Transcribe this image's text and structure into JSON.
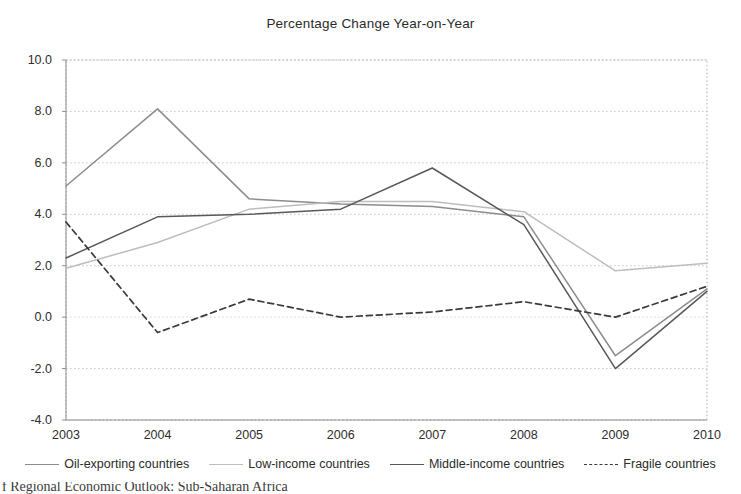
{
  "chart_data": {
    "type": "line",
    "title": "Percentage Change Year-on-Year",
    "xlabel": "",
    "ylabel": "",
    "x": [
      2003,
      2004,
      2005,
      2006,
      2007,
      2008,
      2009,
      2010
    ],
    "categories": [
      "2003",
      "2004",
      "2005",
      "2006",
      "2007",
      "2008",
      "2009",
      "2010"
    ],
    "xlim": [
      2003,
      2010
    ],
    "ylim": [
      -4.0,
      10.0
    ],
    "yticks": [
      "10.0",
      "8.0",
      "6.0",
      "4.0",
      "2.0",
      "0.0",
      "-2.0",
      "-4.0"
    ],
    "ytick_values": [
      10.0,
      8.0,
      6.0,
      4.0,
      2.0,
      0.0,
      -2.0,
      -4.0
    ],
    "grid": true,
    "grid_axis": "y",
    "legend_position": "bottom",
    "series": [
      {
        "name": "Oil-exporting countries",
        "style": "solid",
        "color": "#8c8c8c",
        "values": [
          5.1,
          8.1,
          4.6,
          4.4,
          4.3,
          3.9,
          -1.5,
          1.1
        ]
      },
      {
        "name": "Low-income countries",
        "style": "solid",
        "color": "#bdbdbd",
        "values": [
          1.9,
          2.9,
          4.2,
          4.5,
          4.5,
          4.1,
          1.8,
          2.1
        ]
      },
      {
        "name": "Middle-income countries",
        "style": "solid",
        "color": "#585858",
        "values": [
          2.3,
          3.9,
          4.0,
          4.2,
          5.8,
          3.6,
          -2.0,
          1.0
        ]
      },
      {
        "name": "Fragile countries",
        "style": "dashed",
        "color": "#3a3a3a",
        "values": [
          3.7,
          -0.6,
          0.7,
          0.0,
          0.2,
          0.6,
          0.0,
          1.2
        ]
      }
    ]
  },
  "legend": {
    "items": [
      {
        "label": "Oil-exporting countries"
      },
      {
        "label": "Low-income countries"
      },
      {
        "label": "Middle-income countries"
      },
      {
        "label": "Fragile countries"
      }
    ]
  },
  "caption": {
    "text": "f Regional Economic Outlook: Sub-Saharan Africa"
  }
}
